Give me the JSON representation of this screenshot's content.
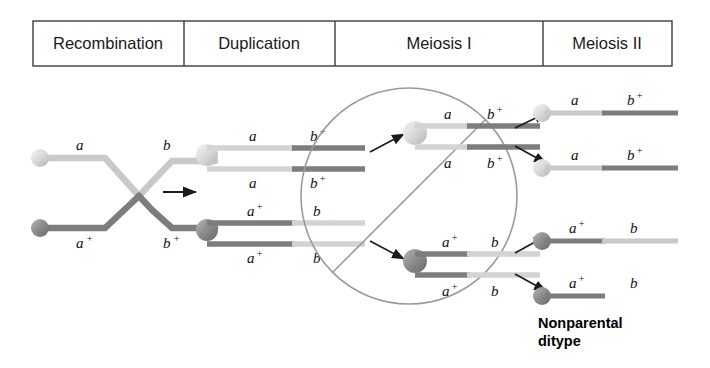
{
  "header": {
    "columns": [
      {
        "label": "Recombination"
      },
      {
        "label": "Duplication"
      },
      {
        "label": "Meiosis I"
      },
      {
        "label": "Meiosis II"
      }
    ]
  },
  "colors": {
    "light_chromatid": "#c9c9c9",
    "dark_chromatid": "#7d7d7d",
    "light_centromere": "#d8d8d8",
    "dark_centromere": "#8a8a8a",
    "cell_outline": "#9a9a9a",
    "arrow": "#1a1a1a",
    "border": "#3c3c3c",
    "text": "#111111"
  },
  "recombination": {
    "top_chromosome": {
      "left_allele": "a",
      "right_allele": "b",
      "shade": "light"
    },
    "bottom_chromosome": {
      "left_allele": "a",
      "left_sup": "+",
      "right_allele": "b",
      "right_sup": "+",
      "shade": "dark"
    },
    "crossover": true
  },
  "transition_arrow": {
    "name": "recombination-to-duplication-arrow"
  },
  "duplication": {
    "top_pair": {
      "chromatids": [
        {
          "left_allele": "a",
          "right_allele": "b",
          "right_sup": "+"
        },
        {
          "left_allele": "a",
          "right_allele": "b",
          "right_sup": "+"
        }
      ]
    },
    "bottom_pair": {
      "chromatids": [
        {
          "left_allele": "a",
          "left_sup": "+",
          "right_allele": "b"
        },
        {
          "left_allele": "a",
          "left_sup": "+",
          "right_allele": "b"
        }
      ]
    }
  },
  "meiosis_one": {
    "cell_shape": "circle-with-division-line",
    "top_cell": {
      "chromatids": [
        {
          "left_allele": "a",
          "right_allele": "b",
          "right_sup": "+"
        },
        {
          "left_allele": "a",
          "right_allele": "b",
          "right_sup": "+"
        }
      ]
    },
    "bottom_cell": {
      "chromatids": [
        {
          "left_allele": "a",
          "left_sup": "+",
          "right_allele": "b"
        },
        {
          "left_allele": "a",
          "left_sup": "+",
          "right_allele": "b"
        }
      ]
    }
  },
  "meiosis_two": {
    "products": [
      {
        "left_allele": "a",
        "left_sup": "",
        "right_allele": "b",
        "right_sup": "+",
        "left_shade": "light",
        "right_shade": "dark"
      },
      {
        "left_allele": "a",
        "left_sup": "",
        "right_allele": "b",
        "right_sup": "+",
        "left_shade": "light",
        "right_shade": "dark"
      },
      {
        "left_allele": "a",
        "left_sup": "+",
        "right_allele": "b",
        "right_sup": "",
        "left_shade": "dark",
        "right_shade": "light"
      },
      {
        "left_allele": "a",
        "left_sup": "+",
        "right_allele": "b",
        "right_sup": "",
        "left_shade": "dark",
        "right_shade": "light"
      }
    ]
  },
  "caption": {
    "line1": "Nonparental",
    "line2": "ditype"
  }
}
